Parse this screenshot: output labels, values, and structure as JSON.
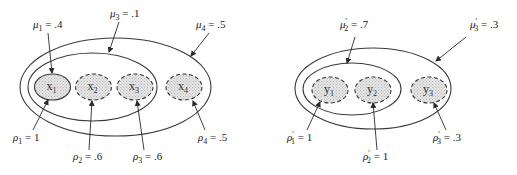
{
  "diagrams": [
    {
      "id": "left",
      "outer": {
        "cx": 115.5,
        "cy": 87,
        "rx": 95.5,
        "ry": 49
      },
      "inner": {
        "cx": 92.5,
        "cy": 87,
        "rx": 64.5,
        "ry": 34
      },
      "nodes": [
        {
          "name": "x",
          "sub": "1",
          "cx": 52.5,
          "cy": 87,
          "style": "solid"
        },
        {
          "name": "x",
          "sub": "2",
          "cx": 93.5,
          "cy": 87,
          "style": "dashed"
        },
        {
          "name": "x",
          "sub": "3",
          "cx": 135,
          "cy": 87,
          "style": "dashed"
        },
        {
          "name": "x",
          "sub": "4",
          "cx": 184,
          "cy": 87,
          "style": "dashed"
        }
      ],
      "mu_labels": [
        {
          "sym": "μ",
          "sub": "1",
          "prime": false,
          "value": ".4",
          "x": 33,
          "y": 28,
          "arrow": [
            48,
            33,
            52,
            73
          ]
        },
        {
          "sym": "μ",
          "sub": "3",
          "prime": false,
          "value": ".1",
          "x": 110,
          "y": 17,
          "arrow": [
            119,
            22,
            109,
            52
          ]
        },
        {
          "sym": "μ",
          "sub": "4",
          "prime": false,
          "value": ".5",
          "x": 196,
          "y": 28,
          "arrow": [
            209,
            33,
            191,
            56
          ]
        }
      ],
      "rho_labels": [
        {
          "sym": "ρ",
          "sub": "1",
          "prime": false,
          "value": "1",
          "x": 13,
          "y": 141,
          "arrow": [
            33,
            130,
            48,
            100
          ]
        },
        {
          "sym": "ρ",
          "sub": "2",
          "prime": false,
          "value": ".6",
          "x": 73,
          "y": 160,
          "arrow": [
            89,
            150,
            92,
            101
          ]
        },
        {
          "sym": "ρ",
          "sub": "3",
          "prime": false,
          "value": ".6",
          "x": 133,
          "y": 160,
          "arrow": [
            144,
            150,
            137,
            101
          ]
        },
        {
          "sym": "ρ",
          "sub": "4",
          "prime": false,
          "value": ".5",
          "x": 198,
          "y": 141,
          "arrow": [
            205,
            130,
            193,
            101
          ]
        }
      ]
    },
    {
      "id": "right",
      "outer": {
        "cx": 373,
        "cy": 88.5,
        "rx": 78,
        "ry": 40.5
      },
      "inner": {
        "cx": 352,
        "cy": 89,
        "rx": 49,
        "ry": 26
      },
      "nodes": [
        {
          "name": "y",
          "sub": "1",
          "cx": 330,
          "cy": 90,
          "style": "dashed"
        },
        {
          "name": "y",
          "sub": "2",
          "cx": 373,
          "cy": 90,
          "style": "dashed"
        },
        {
          "name": "y",
          "sub": "3",
          "cx": 429,
          "cy": 90,
          "style": "dashed"
        }
      ],
      "mu_labels": [
        {
          "sym": "μ",
          "sub": "2",
          "prime": true,
          "value": ".7",
          "x": 340,
          "y": 28,
          "arrow": [
            355,
            37,
            347,
            63
          ]
        },
        {
          "sym": "μ",
          "sub": "3",
          "prime": true,
          "value": ".3",
          "x": 470,
          "y": 28,
          "arrow": [
            466,
            37,
            436,
            61
          ]
        }
      ],
      "rho_labels": [
        {
          "sym": "ρ",
          "sub": "1",
          "prime": true,
          "value": "1",
          "x": 287,
          "y": 141,
          "arrow": [
            307,
            130,
            320,
            102
          ]
        },
        {
          "sym": "ρ",
          "sub": "2",
          "prime": true,
          "value": "1",
          "x": 363,
          "y": 160,
          "arrow": [
            377,
            150,
            373,
            103
          ]
        },
        {
          "sym": "ρ",
          "sub": "3",
          "prime": true,
          "value": ".3",
          "x": 433,
          "y": 141,
          "arrow": [
            446,
            130,
            434,
            103
          ]
        }
      ]
    }
  ],
  "colors": {
    "stroke": "#3a3a3a",
    "node_fill": "#dcdcdc",
    "text": "#222222"
  }
}
